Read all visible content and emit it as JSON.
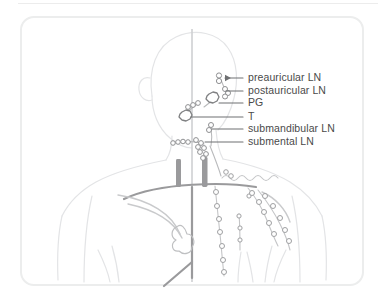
{
  "figure": {
    "view": "anterior",
    "frame": {
      "border_color": "#eceded",
      "background": "#ffffff",
      "radius_px": 14
    },
    "palette": {
      "body_outline": "#e3e4e6",
      "midline": "#cfd0d2",
      "vessel_dark": "#9a9a9c",
      "node_outline": "#8f9092",
      "gland_outline": "#7e7f81",
      "leader_line": "#6f7072",
      "label_text": "#4a4a4a"
    },
    "labels": [
      {
        "id": "preauricular",
        "text": "preauricular LN",
        "x": 248,
        "y": 72,
        "leader_from_x": 243,
        "leader_to_x": 222,
        "leader_y": 78,
        "arrow": true
      },
      {
        "id": "postauricular",
        "text": "postauricular LN",
        "x": 248,
        "y": 85,
        "leader_from_x": 243,
        "leader_to_x": 224,
        "leader_y": 91,
        "arrow": false
      },
      {
        "id": "pg",
        "text": "PG",
        "x": 248,
        "y": 97,
        "leader_from_x": 243,
        "leader_to_x": 219,
        "leader_y": 103,
        "arrow": false
      },
      {
        "id": "t",
        "text": "T",
        "x": 248,
        "y": 111,
        "leader_from_x": 243,
        "leader_to_x": 191,
        "leader_y": 117,
        "arrow": false
      },
      {
        "id": "submandibular",
        "text": "submandibular LN",
        "x": 248,
        "y": 123,
        "leader_from_x": 243,
        "leader_to_x": 212,
        "leader_y": 129,
        "arrow": false
      },
      {
        "id": "submental",
        "text": "submental LN",
        "x": 248,
        "y": 136,
        "leader_from_x": 243,
        "leader_to_x": 205,
        "leader_y": 142,
        "arrow": false
      }
    ],
    "legend_expansions": {
      "LN": "lymph node",
      "PG": "parotid gland",
      "T": "tonsil"
    },
    "structures": [
      "head outline",
      "ear",
      "neck",
      "shoulders",
      "torso",
      "midline",
      "carotid vessels",
      "clavicle",
      "lymphatic chains",
      "lymph nodes"
    ]
  }
}
